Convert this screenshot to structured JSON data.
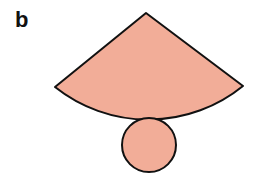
{
  "figure": {
    "panel_label": "b",
    "fill_color": "#f2ad98",
    "stroke_color": "#111111",
    "shapes": [
      {
        "name": "sector",
        "description": "circular sector (cone net)"
      },
      {
        "name": "circle",
        "description": "circular base"
      }
    ]
  }
}
